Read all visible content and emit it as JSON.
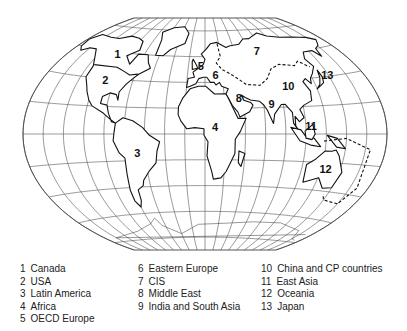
{
  "map": {
    "projection": "winkel-tripel-like",
    "regions_on_map": [
      {
        "id": "1",
        "lon": -105,
        "lat": 58
      },
      {
        "id": "2",
        "lon": -100,
        "lat": 38
      },
      {
        "id": "3",
        "lon": -58,
        "lat": -15
      },
      {
        "id": "4",
        "lon": 20,
        "lat": 5
      },
      {
        "id": "5",
        "lon": 5,
        "lat": 52
      },
      {
        "id": "6",
        "lon": 22,
        "lat": 45
      },
      {
        "id": "7",
        "lon": 80,
        "lat": 62
      },
      {
        "id": "8",
        "lon": 45,
        "lat": 27
      },
      {
        "id": "9",
        "lon": 78,
        "lat": 22
      },
      {
        "id": "10",
        "lon": 100,
        "lat": 35
      },
      {
        "id": "11",
        "lon": 115,
        "lat": 5
      },
      {
        "id": "12",
        "lon": 135,
        "lat": -25
      },
      {
        "id": "13",
        "lon": 148,
        "lat": 40
      }
    ]
  },
  "legend": {
    "columns": [
      [
        {
          "num": "1",
          "label": "Canada"
        },
        {
          "num": "2",
          "label": "USA"
        },
        {
          "num": "3",
          "label": "Latin America"
        },
        {
          "num": "4",
          "label": "Africa"
        },
        {
          "num": "5",
          "label": "OECD Europe"
        }
      ],
      [
        {
          "num": "6",
          "label": "Eastern Europe"
        },
        {
          "num": "7",
          "label": "CIS"
        },
        {
          "num": "8",
          "label": "Middle East"
        },
        {
          "num": "9",
          "label": "India and South Asia"
        }
      ],
      [
        {
          "num": "10",
          "label": "China and CP countries"
        },
        {
          "num": "11",
          "label": "East Asia"
        },
        {
          "num": "12",
          "label": "Oceania"
        },
        {
          "num": "13",
          "label": "Japan"
        }
      ]
    ]
  }
}
